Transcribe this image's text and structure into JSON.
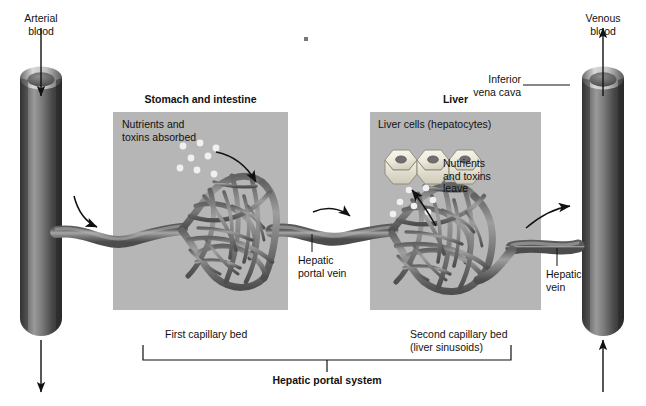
{
  "figure": {
    "type": "anatomical-diagram"
  },
  "labels": {
    "arterial_blood": "Arterial\nblood",
    "venous_blood": "Venous\nblood",
    "inferior_vena_cava": "Inferior\nvena cava",
    "stomach_intestine": "Stomach and intestine",
    "liver": "Liver",
    "nutrients_absorbed": "Nutrients and\ntoxins absorbed",
    "liver_cells": "Liver cells (hepatocytes)",
    "nutrients_leave": "Nutrients\nand toxins\nleave",
    "hepatic_portal_vein": "Hepatic\nportal vein",
    "hepatic_vein": "Hepatic\nvein",
    "first_capillary_bed": "First capillary bed",
    "second_capillary_bed": "Second capillary bed\n(liver sinusoids)",
    "hepatic_portal_system": "Hepatic portal system"
  },
  "colors": {
    "panel_gray": "#b6b6b6",
    "vessel_dark": "#4a4a4a",
    "vessel_mid": "#7d7d7d",
    "vessel_light": "#a9a9a9",
    "cell_fill": "#f2efe4",
    "nucleus": "#6f6f6f",
    "particle": "#efefef",
    "ink": "#111111",
    "background": "#ffffff"
  },
  "icons": {
    "arrow_down": "arrow-down-icon",
    "arrow_up": "arrow-up-icon",
    "flow_arrow": "curved-flow-arrow-icon",
    "leader_line": "leader-line-icon",
    "bracket": "bracket-icon"
  },
  "structures": {
    "left_vessel": "Arterial vessel (vertical tube, left edge)",
    "right_vessel": "Inferior vena cava (vertical tube, right edge)",
    "capillary_bed_1": "First capillary bed of stomach and intestine",
    "capillary_bed_2": "Second capillary bed (liver sinusoids)",
    "hepatocyte_count": 3,
    "particles_left": 8,
    "particles_right": 7
  }
}
